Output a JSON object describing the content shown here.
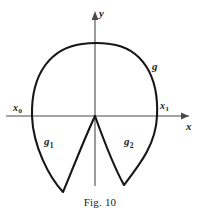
{
  "figure": {
    "caption": "Fig. 10",
    "axes": {
      "y_label": "y",
      "x_label": "x",
      "y_axis_name": "vertical-axis",
      "x_axis_name": "horizontal-axis",
      "origin_px": [
        95,
        116
      ]
    },
    "points": [
      {
        "id": "x0",
        "base": "x",
        "sub": "0",
        "label": "x₀",
        "px": [
          32,
          116
        ]
      },
      {
        "id": "x1",
        "base": "x",
        "sub": "1",
        "label": "x₁",
        "px": [
          157,
          116
        ]
      }
    ],
    "curves": [
      {
        "id": "g",
        "base": "g",
        "sub": "",
        "label": "g",
        "role": "upper-arc"
      },
      {
        "id": "g1",
        "base": "g",
        "sub": "1",
        "label": "g₁",
        "role": "lower-left-lobe"
      },
      {
        "id": "g2",
        "base": "g",
        "sub": "2",
        "label": "g₂",
        "role": "lower-right-lobe"
      }
    ],
    "colors": {
      "background": "#ffffff",
      "curve_stroke": "#161616",
      "axis_stroke": "#4a4a4a",
      "text": "#1c1c1c"
    }
  },
  "chart_data": {
    "type": "line",
    "title": "Fig. 10",
    "xlabel": "x",
    "ylabel": "y",
    "grid": false,
    "legend": "inline-annotations",
    "annotations": [
      {
        "text": "g",
        "x_px": 152,
        "y_px": 61
      },
      {
        "text": "g₁",
        "x_px": 44,
        "y_px": 136
      },
      {
        "text": "g₂",
        "x_px": 124,
        "y_px": 136
      },
      {
        "text": "x₀",
        "x_px": 13,
        "y_px": 103
      },
      {
        "text": "x₁",
        "x_px": 160,
        "y_px": 101
      }
    ],
    "series": [
      {
        "name": "g",
        "description": "upper arc from x0 to x1 through apex above origin",
        "path": "M 32 116 C 31 72 52 48 82 44 C 92 42.5 100 42.5 110 44 C 142 48 159 76 157 116"
      },
      {
        "name": "g1",
        "description": "lower-left lobe: from x0 down to cusp tip, back up to origin",
        "path": "M 32 116 C 33 146 49 177 63 192 C 70 176 82 144 95 116"
      },
      {
        "name": "g2",
        "description": "lower-right lobe: from origin down to cusp tip, back up to x1",
        "path": "M 95 116 C 104 141 115 169 124 185 C 140 164 156 144 157 116"
      }
    ]
  }
}
